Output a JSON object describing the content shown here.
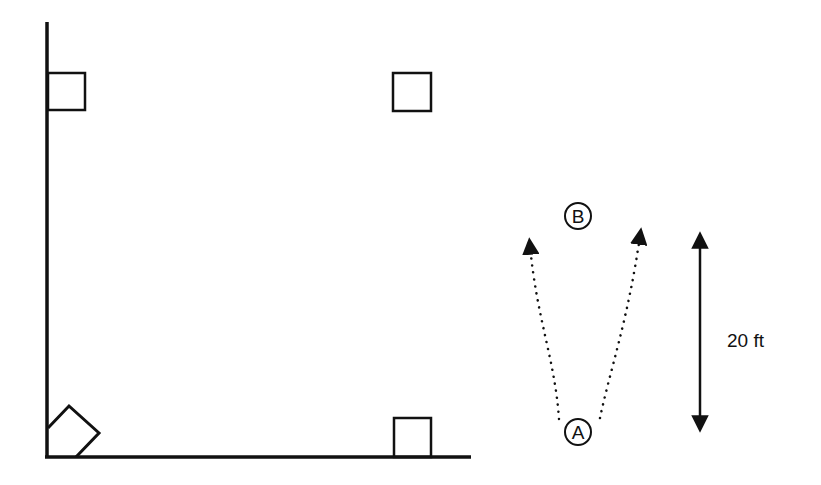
{
  "diagram": {
    "type": "field-drill",
    "colors": {
      "stroke": "#111111",
      "background": "#ffffff"
    },
    "field": {
      "left_line": "vertical foul line",
      "bottom_line": "horizontal foul line"
    },
    "bases": [
      {
        "name": "home-plate",
        "shape": "diamond"
      },
      {
        "name": "base-top-left",
        "shape": "square"
      },
      {
        "name": "base-top-right",
        "shape": "square"
      },
      {
        "name": "base-bottom-right",
        "shape": "square"
      }
    ],
    "players": [
      {
        "id": "A",
        "label": "A"
      },
      {
        "id": "B",
        "label": "B"
      }
    ],
    "paths": [
      {
        "from": "A",
        "direction": "up-left",
        "style": "dotted-arrow"
      },
      {
        "from": "A",
        "direction": "up-right",
        "style": "dotted-arrow"
      }
    ],
    "dimension": {
      "label": "20 ft",
      "style": "double-arrow"
    }
  }
}
